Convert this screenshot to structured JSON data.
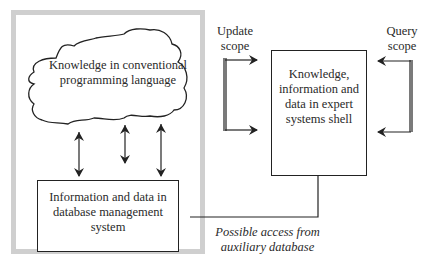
{
  "diagram": {
    "outer_frame": {
      "label": "",
      "color": "#cfcfcf"
    },
    "cloud": {
      "label": "Knowledge in conventional programming language"
    },
    "database_box": {
      "label": "Information and data in database management system"
    },
    "expert_shell_box": {
      "label": "Knowledge, information and data in expert systems shell"
    },
    "update_scope": {
      "label": "Update scope"
    },
    "query_scope": {
      "label": "Query scope"
    },
    "auxiliary_link": {
      "label": "Possible access from auxiliary database"
    },
    "arrows": [
      {
        "from": "cloud",
        "to": "database_box",
        "type": "bidirectional"
      },
      {
        "from": "cloud",
        "to": "database_box",
        "type": "bidirectional"
      },
      {
        "from": "cloud",
        "to": "database_box",
        "type": "bidirectional"
      },
      {
        "from": "update_scope",
        "to": "expert_shell_box",
        "type": "directed",
        "count": 2
      },
      {
        "from": "query_scope",
        "to": "expert_shell_box",
        "type": "directed",
        "count": 2
      },
      {
        "from": "database_box",
        "to": "expert_shell_box",
        "type": "directed",
        "style": "elbow"
      }
    ],
    "colors": {
      "line": "#222222",
      "scope_bar": "#7a7a7a",
      "frame": "#cfcfcf"
    }
  }
}
